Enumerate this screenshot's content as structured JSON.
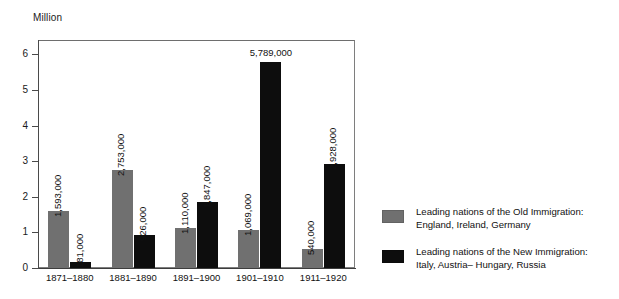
{
  "chart_data": {
    "type": "bar",
    "title": "",
    "xlabel": "",
    "ylabel": "Million",
    "ylim": [
      0,
      6.4
    ],
    "yticks": [
      "0",
      "1",
      "2",
      "3",
      "4",
      "5",
      "6"
    ],
    "grid": false,
    "legend_position": "right",
    "categories": [
      "1871–1880",
      "1881–1890",
      "1891–1900",
      "1901–1910",
      "1911–1920"
    ],
    "series": [
      {
        "name": "Leading nations of the Old Immigration: England, Ireland, Germany",
        "key": "old",
        "color": "#707070",
        "values": [
          1.593,
          2.753,
          1.11,
          1.069,
          0.54
        ],
        "labels": [
          "1,593,000",
          "2,753,000",
          "1,110,000",
          "1,069,000",
          "540,000"
        ]
      },
      {
        "name": "Leading nations of the New Immigration: Italy, Austria– Hungary, Russia",
        "key": "new",
        "color": "#0d0d0d",
        "values": [
          0.181,
          0.926,
          1.847,
          5.789,
          2.928
        ],
        "labels": [
          "181,000",
          "926,000",
          "1,847,000",
          "5,789,000",
          "2,928,000"
        ]
      }
    ]
  },
  "axis": {
    "y_title": "Million"
  },
  "legend": {
    "items": [
      {
        "swatch": "old",
        "line1": "Leading nations of the Old Immigration:",
        "line2": "England, Ireland, Germany"
      },
      {
        "swatch": "new",
        "line1": "Leading nations of the New Immigration:",
        "line2": "Italy, Austria– Hungary, Russia"
      }
    ]
  }
}
